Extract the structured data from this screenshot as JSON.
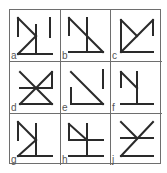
{
  "puzzle": {
    "cells": [
      {
        "label": "a",
        "lines": [
          [
            8,
            8,
            8,
            26
          ],
          [
            8,
            8,
            26,
            26
          ],
          [
            26,
            26,
            8,
            44
          ],
          [
            26,
            15,
            26,
            44
          ],
          [
            40,
            8,
            40,
            27
          ],
          [
            8,
            44,
            42,
            44
          ]
        ]
      },
      {
        "label": "b",
        "lines": [
          [
            8,
            8,
            8,
            25
          ],
          [
            8,
            8,
            42,
            42
          ],
          [
            26,
            8,
            26,
            42
          ],
          [
            8,
            42,
            42,
            42
          ]
        ]
      },
      {
        "label": "c",
        "lines": [
          [
            10,
            10,
            10,
            42
          ],
          [
            10,
            10,
            26,
            26
          ],
          [
            42,
            10,
            10,
            42
          ],
          [
            42,
            10,
            42,
            25
          ],
          [
            10,
            42,
            42,
            42
          ]
        ]
      },
      {
        "label": "d",
        "lines": [
          [
            10,
            10,
            42,
            42
          ],
          [
            42,
            10,
            10,
            42
          ],
          [
            42,
            10,
            42,
            26
          ],
          [
            10,
            26,
            42,
            26
          ],
          [
            10,
            42,
            42,
            42
          ]
        ]
      },
      {
        "label": "e",
        "lines": [
          [
            10,
            10,
            42,
            42
          ],
          [
            10,
            26,
            10,
            42
          ],
          [
            10,
            42,
            42,
            42
          ],
          [
            42,
            8,
            42,
            26
          ]
        ]
      },
      {
        "label": "f",
        "lines": [
          [
            10,
            10,
            10,
            25
          ],
          [
            10,
            10,
            26,
            26
          ],
          [
            26,
            10,
            26,
            42
          ],
          [
            10,
            42,
            42,
            42
          ]
        ]
      },
      {
        "label": "g",
        "lines": [
          [
            8,
            8,
            8,
            26
          ],
          [
            8,
            8,
            26,
            26
          ],
          [
            26,
            26,
            8,
            42
          ],
          [
            26,
            10,
            26,
            42
          ],
          [
            8,
            42,
            42,
            42
          ]
        ]
      },
      {
        "label": "h",
        "lines": [
          [
            8,
            10,
            8,
            25
          ],
          [
            8,
            10,
            26,
            26
          ],
          [
            26,
            10,
            26,
            42
          ],
          [
            8,
            26,
            42,
            26
          ],
          [
            8,
            42,
            42,
            42
          ]
        ]
      },
      {
        "label": "j",
        "lines": [
          [
            10,
            8,
            26,
            24
          ],
          [
            42,
            8,
            10,
            42
          ],
          [
            10,
            24,
            42,
            24
          ],
          [
            10,
            42,
            42,
            42
          ]
        ]
      }
    ]
  },
  "colors": {
    "stroke": "#2a2a2a",
    "grid": "#6e6e6e",
    "label": "#555555",
    "background": "#ffffff"
  }
}
